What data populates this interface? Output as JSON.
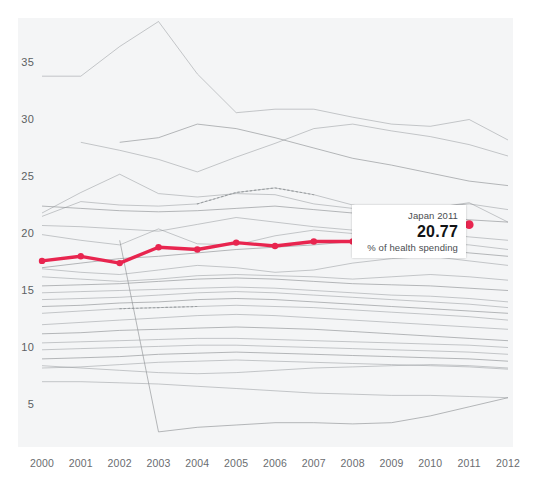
{
  "tooltip": {
    "title": "Japan 2011",
    "value": "20.77",
    "subtitle": "% of health spending"
  },
  "axes": {
    "y_ticks": [
      "5",
      "10",
      "15",
      "20",
      "25",
      "30",
      "35"
    ],
    "x_ticks": [
      "2000",
      "2001",
      "2002",
      "2003",
      "2004",
      "2005",
      "2006",
      "2007",
      "2008",
      "2009",
      "2010",
      "2011",
      "2012"
    ]
  },
  "colors": {
    "highlight": "#e8254f",
    "background_lines": "#8f9396",
    "panel": "#f4f5f6",
    "tick_text": "#5c5f63"
  },
  "chart_data": {
    "type": "line",
    "title": "",
    "xlabel": "",
    "ylabel": "% of health spending",
    "x": [
      2000,
      2001,
      2002,
      2003,
      2004,
      2005,
      2006,
      2007,
      2008,
      2009,
      2010,
      2011,
      2012
    ],
    "xlim": [
      2000,
      2012
    ],
    "ylim": [
      2.2,
      39.8
    ],
    "grid": false,
    "legend": "none",
    "annotations": [
      {
        "text": "Japan 2011",
        "value": 20.77,
        "sublabel": "% of health spending",
        "x": 2011,
        "y": 20.77
      }
    ],
    "series": [
      {
        "name": "Japan",
        "highlight": true,
        "color": "#e8254f",
        "markers": true,
        "values": [
          17.6,
          18.0,
          17.4,
          18.8,
          18.6,
          19.2,
          18.9,
          19.3,
          19.3,
          null,
          null,
          20.77,
          null
        ]
      },
      {
        "name": "line-01",
        "highlight": false,
        "values": [
          33.8,
          33.8,
          36.4,
          38.6,
          34.0,
          30.6,
          30.9,
          30.9,
          30.2,
          29.6,
          29.4,
          30.0,
          28.2
        ]
      },
      {
        "name": "line-02",
        "highlight": false,
        "values": [
          null,
          28.0,
          27.3,
          26.5,
          25.4,
          26.7,
          27.9,
          29.2,
          29.6,
          29.0,
          28.5,
          27.8,
          26.8
        ]
      },
      {
        "name": "line-03",
        "highlight": false,
        "values": [
          null,
          null,
          28.0,
          28.4,
          29.6,
          29.2,
          28.4,
          27.5,
          26.6,
          26.0,
          25.3,
          24.6,
          24.2
        ]
      },
      {
        "name": "line-04",
        "highlight": false,
        "values": [
          21.8,
          23.6,
          25.2,
          23.5,
          23.2,
          23.5,
          23.4,
          22.6,
          22.2,
          22.0,
          22.3,
          22.6,
          22.1
        ]
      },
      {
        "name": "line-05",
        "highlight": false,
        "values": [
          21.5,
          22.8,
          22.5,
          22.4,
          22.6,
          23.6,
          24.0,
          23.4,
          22.5,
          21.8,
          22.2,
          22.7,
          21.0
        ],
        "dashed_from": 2004,
        "dashed_to": 2007
      },
      {
        "name": "line-06",
        "highlight": false,
        "values": [
          22.4,
          22.2,
          22.0,
          21.9,
          22.0,
          22.2,
          22.4,
          22.1,
          21.8,
          21.6,
          21.4,
          21.2,
          21.0
        ]
      },
      {
        "name": "line-07",
        "highlight": false,
        "values": [
          20.7,
          20.6,
          20.4,
          20.2,
          20.8,
          21.4,
          21.0,
          20.6,
          20.3,
          20.1,
          20.0,
          19.7,
          19.4
        ]
      },
      {
        "name": "line-08",
        "highlight": false,
        "values": [
          19.9,
          19.4,
          19.0,
          20.4,
          19.1,
          19.0,
          19.8,
          20.3,
          20.0,
          19.5,
          19.2,
          19.0,
          18.6
        ]
      },
      {
        "name": "line-09",
        "highlight": false,
        "values": [
          17.0,
          17.4,
          17.8,
          18.0,
          18.3,
          18.6,
          18.8,
          19.0,
          19.3,
          19.0,
          18.6,
          18.3,
          18.0
        ]
      },
      {
        "name": "line-10",
        "highlight": false,
        "values": [
          16.9,
          16.6,
          16.4,
          16.8,
          17.2,
          17.0,
          16.6,
          16.8,
          17.4,
          17.8,
          18.0,
          17.6,
          17.2
        ]
      },
      {
        "name": "line-11",
        "highlight": false,
        "values": [
          16.2,
          16.0,
          15.8,
          16.0,
          16.3,
          16.4,
          16.3,
          16.2,
          16.0,
          16.2,
          16.4,
          16.2,
          15.9
        ]
      },
      {
        "name": "line-12",
        "highlight": false,
        "values": [
          15.4,
          15.5,
          15.6,
          15.8,
          16.0,
          16.1,
          16.0,
          15.8,
          15.6,
          15.5,
          15.4,
          15.2,
          15.0
        ]
      },
      {
        "name": "line-13",
        "highlight": false,
        "values": [
          14.8,
          14.9,
          15.0,
          15.1,
          15.2,
          15.3,
          15.2,
          15.0,
          14.8,
          14.6,
          14.5,
          14.3,
          14.0
        ]
      },
      {
        "name": "line-14",
        "highlight": false,
        "values": [
          14.2,
          14.3,
          14.4,
          14.6,
          14.8,
          14.9,
          14.8,
          14.6,
          14.4,
          14.2,
          14.0,
          13.8,
          13.5
        ]
      },
      {
        "name": "line-15",
        "highlight": false,
        "values": [
          13.6,
          13.7,
          13.9,
          14.0,
          14.2,
          14.3,
          14.2,
          14.0,
          13.8,
          13.6,
          13.4,
          13.2,
          13.0
        ]
      },
      {
        "name": "line-16",
        "highlight": false,
        "values": [
          13.0,
          13.2,
          13.4,
          13.5,
          13.6,
          13.7,
          13.6,
          13.5,
          13.3,
          13.1,
          12.9,
          12.7,
          12.4
        ],
        "dashed_from": 2002,
        "dashed_to": 2004
      },
      {
        "name": "line-17",
        "highlight": false,
        "values": [
          12.0,
          12.2,
          12.4,
          12.6,
          12.8,
          12.9,
          12.8,
          12.6,
          12.4,
          12.2,
          12.0,
          11.8,
          11.6
        ]
      },
      {
        "name": "line-18",
        "highlight": false,
        "values": [
          11.2,
          11.3,
          11.5,
          11.6,
          11.7,
          11.8,
          11.7,
          11.6,
          11.4,
          11.2,
          11.0,
          10.8,
          10.6
        ]
      },
      {
        "name": "line-19",
        "highlight": false,
        "values": [
          10.4,
          10.5,
          10.6,
          10.7,
          10.8,
          10.8,
          10.7,
          10.6,
          10.5,
          10.4,
          10.3,
          10.2,
          10.0
        ]
      },
      {
        "name": "line-20",
        "highlight": false,
        "values": [
          9.8,
          9.9,
          10.0,
          10.1,
          10.2,
          10.2,
          10.1,
          10.0,
          9.9,
          9.8,
          9.7,
          9.6,
          9.4
        ]
      },
      {
        "name": "line-21",
        "highlight": false,
        "values": [
          9.0,
          9.1,
          9.2,
          9.4,
          9.5,
          9.6,
          9.5,
          9.4,
          9.3,
          9.2,
          9.1,
          9.0,
          8.8
        ]
      },
      {
        "name": "line-22",
        "highlight": false,
        "values": [
          8.2,
          8.3,
          8.5,
          8.7,
          8.8,
          8.9,
          8.8,
          8.7,
          8.6,
          8.5,
          8.4,
          8.3,
          8.1
        ]
      },
      {
        "name": "line-23",
        "highlight": false,
        "values": [
          8.4,
          8.2,
          8.0,
          7.8,
          7.7,
          7.8,
          8.0,
          8.2,
          8.3,
          8.4,
          8.5,
          8.4,
          8.2
        ]
      },
      {
        "name": "line-24",
        "highlight": false,
        "values": [
          null,
          null,
          19.4,
          2.6,
          3.0,
          3.2,
          3.4,
          3.4,
          3.3,
          3.4,
          4.0,
          4.8,
          5.6
        ]
      },
      {
        "name": "line-25",
        "highlight": false,
        "values": [
          7.0,
          7.0,
          6.9,
          6.8,
          6.6,
          6.4,
          6.2,
          6.0,
          5.9,
          5.8,
          5.8,
          5.7,
          5.6
        ]
      }
    ]
  }
}
